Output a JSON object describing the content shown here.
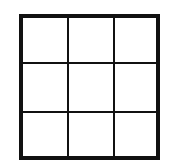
{
  "diagram": {
    "type": "grid",
    "rows": 3,
    "columns": 3,
    "cells": [
      [
        "",
        "",
        ""
      ],
      [
        "",
        "",
        ""
      ],
      [
        "",
        "",
        ""
      ]
    ],
    "line_color": "#111111",
    "background_color": "#ffffff"
  }
}
